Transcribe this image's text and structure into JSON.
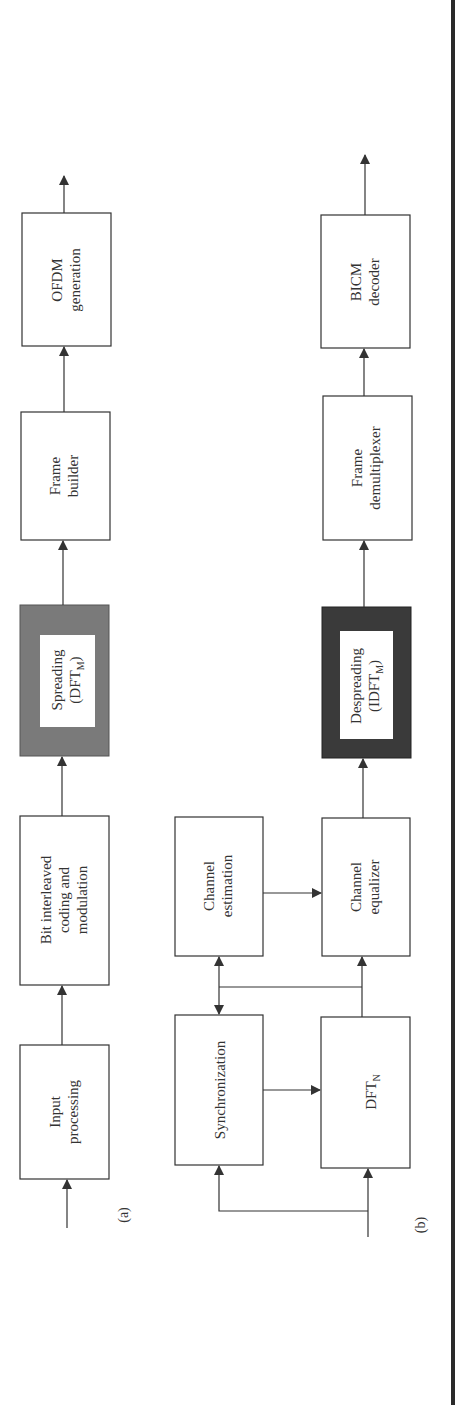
{
  "figure": {
    "orientation": "rotated 90deg counter-clockwise",
    "panels": [
      {
        "caption": "(a)",
        "blocks": [
          {
            "id": "input_processing",
            "lines": [
              "Input",
              "processing"
            ]
          },
          {
            "id": "bicm",
            "lines": [
              "Bit interleaved",
              "coding and",
              "modulation"
            ]
          },
          {
            "id": "spreading",
            "lines": [
              "Spreading",
              "(DFT"
            ],
            "subscript": "M",
            "suffix": ")",
            "style": "shaded-gray"
          },
          {
            "id": "frame_builder",
            "lines": [
              "Frame",
              "builder"
            ]
          },
          {
            "id": "ofdm_generation",
            "lines": [
              "OFDM",
              "generation"
            ]
          }
        ]
      },
      {
        "caption": "(b)",
        "blocks": [
          {
            "id": "synchronization",
            "lines": [
              "Synchronization"
            ]
          },
          {
            "id": "dft_n",
            "lines": [
              "DFT"
            ],
            "subscript": "N"
          },
          {
            "id": "channel_estimation",
            "lines": [
              "Channel",
              "estimation"
            ]
          },
          {
            "id": "channel_equalizer",
            "lines": [
              "Channel",
              "equalizer"
            ]
          },
          {
            "id": "despreading",
            "lines": [
              "Despreading",
              "(IDFT"
            ],
            "subscript": "M",
            "suffix": ")",
            "style": "shaded-dark"
          },
          {
            "id": "frame_demultiplexer",
            "lines": [
              "Frame",
              "demultiplexer"
            ]
          },
          {
            "id": "bicm_decoder",
            "lines": [
              "BICM",
              "decoder"
            ]
          }
        ]
      }
    ],
    "colors": {
      "stroke": "#333333",
      "spreading_fill": "#7a7a7a",
      "despreading_fill": "#3a3a3a",
      "rule": "#2a2a2a"
    }
  }
}
